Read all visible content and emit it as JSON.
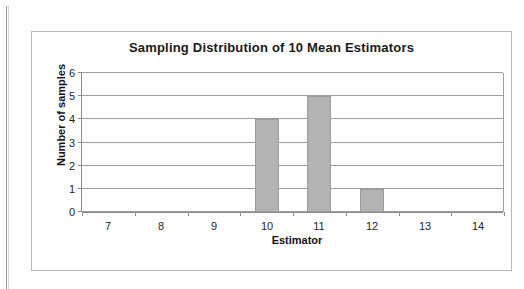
{
  "chart_data": {
    "type": "bar",
    "title": "Sampling Distribution of 10 Mean Estimators",
    "xlabel": "Estimator",
    "ylabel": "Number of samples",
    "categories": [
      "7",
      "8",
      "9",
      "10",
      "11",
      "12",
      "13",
      "14"
    ],
    "values": [
      0,
      0,
      0,
      4,
      5,
      1,
      0,
      0
    ],
    "ytick_labels": [
      "0",
      "1",
      "2",
      "3",
      "4",
      "5",
      "6"
    ],
    "ylim": [
      0,
      6
    ],
    "grid": "horizontal",
    "legend": "none",
    "bar_color": "#b3b3b3",
    "bar_border_color": "#9c9c9c",
    "gridline_color": "#9e9e9e",
    "frame_color": "#b9b9b9",
    "text_color": "#1a1a1a",
    "background": "#ffffff"
  }
}
